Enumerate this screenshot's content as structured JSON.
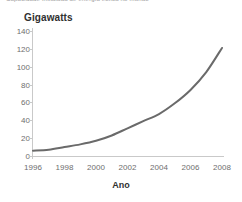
{
  "caption": {
    "text": "Capacidade instalada de energia eólica no mundo"
  },
  "chart_data": {
    "type": "line",
    "title": "",
    "subtitle": "",
    "xlabel": "Ano",
    "ylabel": "Gigawatts",
    "x": [
      1996,
      1997,
      1998,
      1999,
      2000,
      2001,
      2002,
      2003,
      2004,
      2005,
      2006,
      2007,
      2008
    ],
    "values": [
      6,
      7,
      10,
      13,
      17,
      23,
      31,
      39,
      47,
      59,
      74,
      94,
      121
    ],
    "series": [
      {
        "name": "Gigawatts",
        "values": [
          6,
          7,
          10,
          13,
          17,
          23,
          31,
          39,
          47,
          59,
          74,
          94,
          121
        ]
      }
    ],
    "xlim": [
      1996,
      2008
    ],
    "ylim": [
      0,
      140
    ],
    "xticks": [
      1996,
      1998,
      2000,
      2002,
      2004,
      2006,
      2008
    ],
    "xtick_labels": [
      "1996",
      "1998",
      "2000",
      "2002",
      "2004",
      "2006",
      "2008"
    ],
    "yticks": [
      0,
      20,
      40,
      60,
      80,
      100,
      120,
      140
    ],
    "ytick_labels": [
      "0",
      "20",
      "40",
      "60",
      "80",
      "100",
      "120",
      "140"
    ],
    "grid": false,
    "legend": false,
    "legend_position": "none",
    "line_color": "#6a6a6a",
    "line_width": 2,
    "background_color": "#ffffff",
    "axis_color": "#c9c9c9",
    "tick_label_color": "#6e6e6e",
    "axis_title_color": "#303030"
  }
}
